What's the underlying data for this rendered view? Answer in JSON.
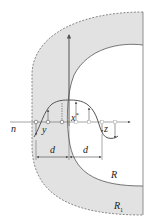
{
  "diagram": {
    "colors": {
      "shade": "#e2e2e2",
      "stroke": "#555555",
      "dashed": "#888888",
      "text": "#222222"
    },
    "labels": {
      "axis_n": "n",
      "point_x": "x",
      "point_x_sup": "*",
      "point_y": "y",
      "point_z": "z",
      "dist_left": "d",
      "dist_right": "d",
      "radius_inner": "R",
      "radius_outer": "R",
      "radius_outer_sub": "1"
    }
  }
}
